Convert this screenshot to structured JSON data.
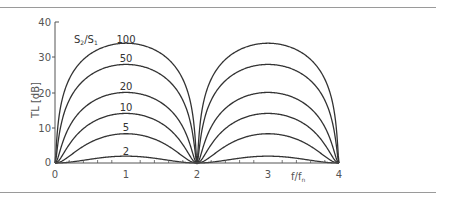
{
  "chart_data": {
    "type": "line",
    "title": "",
    "xlabel": "f/f_n",
    "ylabel": "TL [dB]",
    "xlim": [
      0,
      4
    ],
    "ylim": [
      0,
      40
    ],
    "xticks": [
      0,
      1,
      2,
      3,
      4
    ],
    "yticks": [
      0,
      10,
      20,
      30,
      40
    ],
    "legend_title": "S2/S1",
    "grid": false,
    "x": [
      0,
      0.1,
      0.2,
      0.3,
      0.4,
      0.5,
      0.6,
      0.7,
      0.8,
      0.9,
      1.0,
      1.1,
      1.2,
      1.3,
      1.4,
      1.5,
      1.6,
      1.7,
      1.8,
      1.9,
      2.0,
      2.1,
      2.2,
      2.3,
      2.4,
      2.5,
      2.6,
      2.7,
      2.8,
      2.9,
      3.0,
      3.1,
      3.2,
      3.3,
      3.4,
      3.5,
      3.6,
      3.7,
      3.8,
      3.9,
      4.0
    ],
    "series": [
      {
        "name": "100",
        "peak": 34.0,
        "values": [
          0,
          24.0,
          29.8,
          32.2,
          33.5,
          33.8,
          33.9,
          34.0,
          34.0,
          34.0,
          34.0,
          34.0,
          34.0,
          34.0,
          33.9,
          33.8,
          33.5,
          32.2,
          29.8,
          24.0,
          0,
          24.0,
          29.8,
          32.2,
          33.5,
          33.8,
          33.9,
          34.0,
          34.0,
          34.0,
          34.0,
          34.0,
          34.0,
          34.0,
          33.9,
          33.8,
          33.5,
          32.2,
          29.8,
          24.0,
          0
        ]
      },
      {
        "name": "50",
        "peak": 28.0,
        "values": [
          0,
          18.1,
          23.8,
          26.2,
          27.4,
          27.8,
          27.9,
          28.0,
          28.0,
          28.0,
          28.0,
          28.0,
          28.0,
          28.0,
          27.9,
          27.8,
          27.4,
          26.2,
          23.8,
          18.1,
          0,
          18.1,
          23.8,
          26.2,
          27.4,
          27.8,
          27.9,
          28.0,
          28.0,
          28.0,
          28.0,
          28.0,
          28.0,
          28.0,
          27.9,
          27.8,
          27.4,
          26.2,
          23.8,
          18.1,
          0
        ]
      },
      {
        "name": "20",
        "peak": 20.0,
        "values": [
          0,
          10.6,
          16.0,
          18.3,
          19.4,
          19.9,
          20.0,
          20.0,
          20.0,
          20.0,
          20.0,
          20.0,
          20.0,
          20.0,
          20.0,
          19.9,
          19.4,
          18.3,
          16.0,
          10.6,
          0,
          10.6,
          16.0,
          18.3,
          19.4,
          19.9,
          20.0,
          20.0,
          20.0,
          20.0,
          20.0,
          20.0,
          20.0,
          20.0,
          20.0,
          19.9,
          19.4,
          18.3,
          16.0,
          10.6,
          0
        ]
      },
      {
        "name": "10",
        "peak": 14.0,
        "values": [
          0,
          5.6,
          10.3,
          12.4,
          13.5,
          13.9,
          14.0,
          14.0,
          14.0,
          14.0,
          14.0,
          14.0,
          14.0,
          14.0,
          14.0,
          13.9,
          13.5,
          12.4,
          10.3,
          5.6,
          0,
          5.6,
          10.3,
          12.4,
          13.5,
          13.9,
          14.0,
          14.0,
          14.0,
          14.0,
          14.0,
          14.0,
          14.0,
          14.0,
          14.0,
          13.9,
          13.5,
          12.4,
          10.3,
          5.6,
          0
        ]
      },
      {
        "name": "5",
        "peak": 8.0,
        "values": [
          0,
          1.9,
          4.9,
          6.7,
          7.6,
          7.9,
          8.0,
          8.0,
          8.0,
          8.0,
          8.0,
          8.0,
          8.0,
          8.0,
          8.0,
          7.9,
          7.6,
          6.7,
          4.9,
          1.9,
          0,
          1.9,
          4.9,
          6.7,
          7.6,
          7.9,
          8.0,
          8.0,
          8.0,
          8.0,
          8.0,
          8.0,
          8.0,
          8.0,
          8.0,
          7.9,
          7.6,
          6.7,
          4.9,
          1.9,
          0
        ]
      },
      {
        "name": "2",
        "peak": 1.9,
        "values": [
          0,
          0.1,
          0.5,
          0.9,
          1.3,
          1.6,
          1.7,
          1.8,
          1.9,
          1.9,
          1.9,
          1.9,
          1.9,
          1.8,
          1.7,
          1.6,
          1.3,
          0.9,
          0.5,
          0.1,
          0,
          0.1,
          0.5,
          0.9,
          1.3,
          1.6,
          1.7,
          1.8,
          1.9,
          1.9,
          1.9,
          1.9,
          1.9,
          1.8,
          1.7,
          1.6,
          1.3,
          0.9,
          0.5,
          0.1,
          0
        ]
      }
    ],
    "formula": "TL = 10*log10(1 + 0.25*(m - 1/m)^2 * sin^2(pi/2 * f/f_n)), m = S2/S1"
  },
  "labels": {
    "ylabel": "TL [dB]",
    "xlabel_main": "f/f",
    "xlabel_sub": "n",
    "legend_main_1": "S",
    "legend_sub_1": "2",
    "legend_slash": "/S",
    "legend_sub_2": "1",
    "y0": "0",
    "y10": "10",
    "y20": "20",
    "y30": "30",
    "y40": "40",
    "x0": "0",
    "x1": "1",
    "x2": "2",
    "x3": "3",
    "x4": "4",
    "c100": "100",
    "c50": "50",
    "c20": "20",
    "c10": "10",
    "c5": "5",
    "c2": "2"
  }
}
